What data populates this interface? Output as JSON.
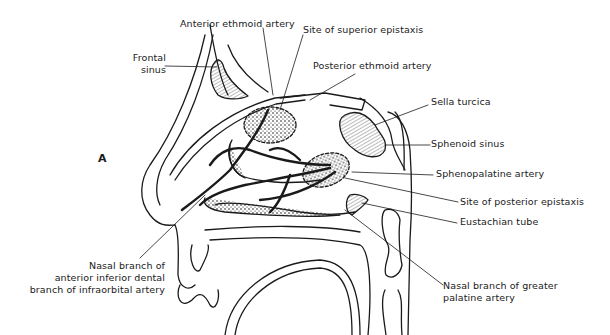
{
  "figure": {
    "panel_letter": "A"
  },
  "labels": {
    "anterior_ethmoid_artery": "Anterior ethmoid artery",
    "site_superior_epistaxis": "Site of superior epistaxis",
    "frontal_sinus_1": "Frontal",
    "frontal_sinus_2": "sinus",
    "posterior_ethmoid_artery": "Posterior ethmoid artery",
    "sella_turcica": "Sella turcica",
    "sphenoid_sinus": "Sphenoid sinus",
    "sphenopalatine_artery": "Sphenopalatine artery",
    "site_posterior_epistaxis": "Site of posterior epistaxis",
    "eustachian_tube": "Eustachian tube",
    "nasal_branch_dental_1": "Nasal branch of",
    "nasal_branch_dental_2": "anterior inferior dental",
    "nasal_branch_dental_3": "branch of infraorbital artery",
    "nasal_branch_palatine_1": "Nasal branch of greater",
    "nasal_branch_palatine_2": "palatine artery"
  },
  "colors": {
    "ink": "#1a1a1a",
    "background": "#ffffff"
  }
}
